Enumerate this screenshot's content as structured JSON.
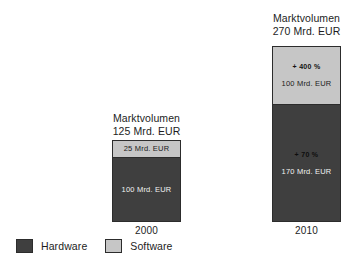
{
  "chart_data": {
    "type": "bar",
    "title": "",
    "subtitle": "",
    "xlabel": "",
    "ylabel": "",
    "stacked": true,
    "grid": false,
    "legend_position": "bottom-left",
    "unit": "Mrd. EUR",
    "categories": [
      "2000",
      "2010"
    ],
    "series": [
      {
        "name": "Hardware",
        "color": "#3f3f3f",
        "values": [
          100,
          170
        ]
      },
      {
        "name": "Software",
        "color": "#c6c6c6",
        "values": [
          25,
          100
        ]
      }
    ],
    "totals": [
      125,
      270
    ],
    "annotations": [
      {
        "category": "2000",
        "series": "Software",
        "value_label": "25 Mrd. EUR",
        "pct_label": ""
      },
      {
        "category": "2000",
        "series": "Hardware",
        "value_label": "100 Mrd. EUR",
        "pct_label": ""
      },
      {
        "category": "2010",
        "series": "Software",
        "value_label": "100 Mrd. EUR",
        "pct_label": "+ 400 %"
      },
      {
        "category": "2010",
        "series": "Hardware",
        "value_label": "170 Mrd. EUR",
        "pct_label": "+ 70 %"
      }
    ]
  },
  "groups": {
    "y2000": {
      "caption_title": "Marktvolumen",
      "caption_value": "125 Mrd. EUR",
      "axis_label": "2000",
      "software": {
        "pct": "",
        "value": "25 Mrd. EUR"
      },
      "hardware": {
        "pct": "",
        "value": "100 Mrd. EUR"
      }
    },
    "y2010": {
      "caption_title": "Marktvolumen",
      "caption_value": "270 Mrd. EUR",
      "axis_label": "2010",
      "software": {
        "pct": "+ 400 %",
        "value": "100 Mrd. EUR"
      },
      "hardware": {
        "pct": "+ 70 %",
        "value": "170 Mrd. EUR"
      }
    }
  },
  "legend": {
    "items": [
      {
        "label": "Hardware",
        "color": "#3f3f3f"
      },
      {
        "label": "Software",
        "color": "#c6c6c6"
      }
    ]
  }
}
